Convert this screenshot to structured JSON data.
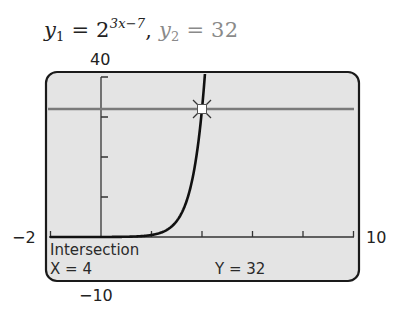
{
  "header": {
    "eq1_var": "y",
    "eq1_sub": "1",
    "eq1_base": " = 2",
    "eq1_exp": "3x−7",
    "eq1_sep": ", ",
    "eq2_var": "y",
    "eq2_sub": "2",
    "eq2_rest": " = 32"
  },
  "window": {
    "ymax_label": "40",
    "ymin_label": "−10",
    "xmin_label": "−2",
    "xmax_label": "10"
  },
  "readout": {
    "title": "Intersection",
    "x_text": "X = 4",
    "y_text": "Y = 32"
  },
  "colors": {
    "screen_bg": "#e4e4e4",
    "frame": "#1a1a1a",
    "curve": "#111111",
    "line": "#7a7a7a",
    "axis": "#333333"
  },
  "chart_data": {
    "type": "line",
    "xlim": [
      -2,
      10
    ],
    "ylim": [
      -10,
      40
    ],
    "xscale_ticks": 2,
    "yscale_ticks": 10,
    "x_tick_values": [
      -2,
      0,
      2,
      4,
      6,
      8,
      10
    ],
    "y_tick_values": [
      0,
      10,
      20,
      30,
      40
    ],
    "series": [
      {
        "name": "y1 = 2^(3x−7)",
        "x": [
          -2,
          0,
          1,
          2,
          2.5,
          3,
          3.25,
          3.5,
          3.75,
          4,
          4.1,
          4.2,
          4.25
        ],
        "values": [
          0.0,
          0.0078,
          0.0625,
          0.5,
          1.41,
          4,
          6.73,
          11.31,
          19.03,
          32,
          39.4,
          48.5,
          53.8
        ]
      },
      {
        "name": "y2 = 32",
        "x": [
          -2,
          10
        ],
        "values": [
          32,
          32
        ]
      }
    ],
    "annotations": [
      {
        "type": "intersection",
        "x": 4,
        "y": 32,
        "label": "Intersection X = 4 Y = 32"
      }
    ],
    "grid": false,
    "legend": "none"
  }
}
